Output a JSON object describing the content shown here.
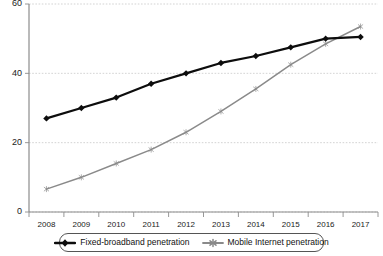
{
  "chart_data": {
    "type": "line",
    "title": "",
    "xlabel": "",
    "ylabel": "",
    "categories": [
      "2008",
      "2009",
      "2010",
      "2011",
      "2012",
      "2013",
      "2014",
      "2015",
      "2016",
      "2017"
    ],
    "x": [
      2008,
      2009,
      2010,
      2011,
      2012,
      2013,
      2014,
      2015,
      2016,
      2017
    ],
    "ylim": [
      0,
      60
    ],
    "xlim": [
      2007.5,
      2017.5
    ],
    "yticks": [
      0,
      20,
      40,
      60
    ],
    "ytick_labels": [
      "0",
      "20",
      "40",
      "60"
    ],
    "xtick_labels": [
      "2008",
      "2009",
      "2010",
      "2011",
      "2012",
      "2013",
      "2014",
      "2015",
      "2016",
      "2017"
    ],
    "grid": true,
    "grid_axis": "y",
    "legend_position": "bottom",
    "series": [
      {
        "name": "Fixed-broadband penetration",
        "color": "#0d0d0d",
        "marker": "diamond",
        "values": [
          27,
          30,
          33,
          37,
          40,
          43,
          45,
          47.5,
          50,
          50.5
        ]
      },
      {
        "name": "Mobile Internet penetration",
        "color": "#8a8a8a",
        "marker": "star",
        "values": [
          6.6,
          10,
          14,
          18,
          23,
          29,
          35.5,
          42.5,
          48.5,
          53.5
        ]
      }
    ]
  },
  "legend": {
    "entries": [
      {
        "label": "Fixed-broadband penetration"
      },
      {
        "label": "Mobile Internet penetration"
      }
    ]
  },
  "colors": {
    "fixed_broadband": "#0d0d0d",
    "mobile_internet": "#8a8a8a",
    "gridline": "#c8c8c8",
    "axis": "#8c8c8c",
    "background": "#ffffff"
  }
}
